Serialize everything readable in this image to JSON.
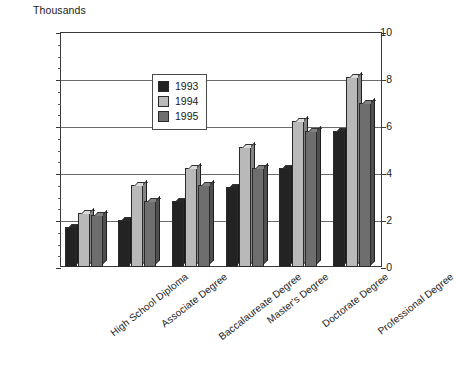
{
  "chart_data": {
    "type": "bar",
    "title": "",
    "subtitle": "",
    "unit_label": "Thousands",
    "xlabel": "",
    "ylabel": "Thousands",
    "ylim": [
      0,
      10
    ],
    "yticks": [
      0,
      2,
      4,
      6,
      8,
      10
    ],
    "ytick_labels": [
      "0",
      "2",
      "4",
      "6",
      "8",
      "10"
    ],
    "y_minor_step": 0.5,
    "grid": true,
    "grid_axis": "y",
    "legend_position": "upper-center-left",
    "categories": [
      "High School Diploma",
      "Associate Degree",
      "Baccalaureate Degree",
      "Master's Degree",
      "Doctorate Degree",
      "Professional Degree"
    ],
    "series": [
      {
        "name": "1993",
        "color": "#232323",
        "values": [
          1.7,
          2.0,
          2.8,
          3.4,
          4.2,
          5.8
        ]
      },
      {
        "name": "1994",
        "color": "#b9b9b9",
        "values": [
          2.3,
          3.5,
          4.2,
          5.1,
          6.2,
          8.1
        ]
      },
      {
        "name": "1995",
        "color": "#6e6e6e",
        "values": [
          2.2,
          2.8,
          3.5,
          4.2,
          5.8,
          7.0
        ]
      }
    ]
  },
  "legend": {
    "items": [
      {
        "label": "1993",
        "color": "#232323"
      },
      {
        "label": "1994",
        "color": "#b9b9b9"
      },
      {
        "label": "1995",
        "color": "#6e6e6e"
      }
    ]
  },
  "colors": {
    "axis": "#3a3a3a",
    "grid": "#6b6b6b",
    "background": "#ffffff",
    "text": "#1a1a1a",
    "series_1993": "#232323",
    "series_1994": "#b9b9b9",
    "series_1995": "#6e6e6e"
  }
}
